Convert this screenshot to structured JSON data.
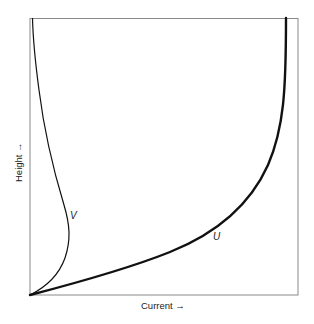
{
  "diagram": {
    "type": "velocity-profile",
    "xlabel": "Current →",
    "ylabel": "Height →",
    "curves": [
      {
        "name": "U",
        "label": "U",
        "description": "thick curve from origin rising to vertical near right edge"
      },
      {
        "name": "V",
        "label": "V",
        "description": "thin curve from origin bulging right then returning toward left edge at top"
      }
    ],
    "colors": {
      "frame": "#8a8a8a",
      "curve": "#111111",
      "text": "#222222",
      "background": "#ffffff"
    }
  }
}
